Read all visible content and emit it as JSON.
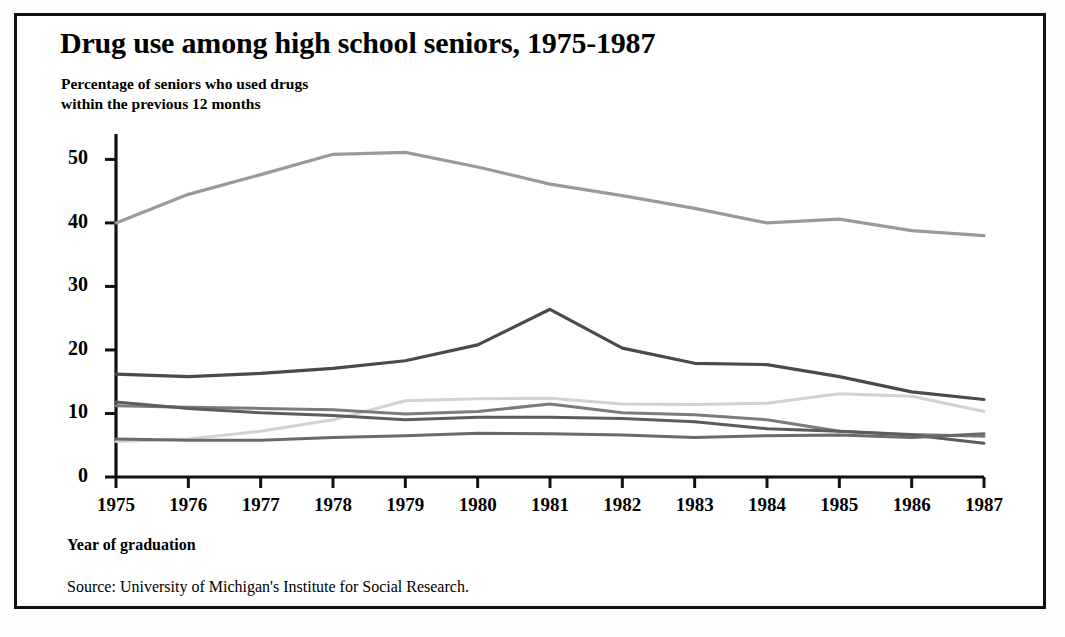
{
  "figure": {
    "title": "Drug use among high school seniors, 1975-1987",
    "subtitle": "Percentage of seniors who used drugs\nwithin the previous 12 months",
    "xaxis_title": "Year of graduation",
    "source": "Source: University of Michigan's Institute for Social Research.",
    "frame_color": "#111111",
    "background_color": "#ffffff"
  },
  "chart_data": {
    "type": "line",
    "title": "Drug use among high school seniors, 1975-1987",
    "subtitle": "Percentage of seniors who used drugs within the previous 12 months",
    "xlabel": "Year of graduation",
    "ylabel": "",
    "categories": [
      "1975",
      "1976",
      "1977",
      "1978",
      "1979",
      "1980",
      "1981",
      "1982",
      "1983",
      "1984",
      "1985",
      "1986",
      "1987"
    ],
    "x": [
      1975,
      1976,
      1977,
      1978,
      1979,
      1980,
      1981,
      1982,
      1983,
      1984,
      1985,
      1986,
      1987
    ],
    "xlim": [
      1975,
      1987
    ],
    "ylim": [
      0,
      54
    ],
    "yticks": [
      0,
      10,
      20,
      30,
      40,
      50
    ],
    "xticks": [
      1975,
      1976,
      1977,
      1978,
      1979,
      1980,
      1981,
      1982,
      1983,
      1984,
      1985,
      1986,
      1987
    ],
    "ytick_labels": [
      "0",
      "10",
      "20",
      "30",
      "40",
      "50"
    ],
    "grid": false,
    "legend": "none",
    "series": [
      {
        "name": "marijuana",
        "color": "#9a9a9a",
        "width": 3.2,
        "values": [
          40.0,
          44.5,
          47.6,
          50.8,
          51.1,
          48.8,
          46.1,
          44.3,
          42.3,
          40.0,
          40.6,
          38.8,
          38.0
        ]
      },
      {
        "name": "stimulants",
        "color": "#4a4a4a",
        "width": 3.2,
        "values": [
          16.2,
          15.8,
          16.3,
          17.1,
          18.3,
          20.8,
          26.4,
          20.3,
          17.9,
          17.7,
          15.8,
          13.4,
          12.2
        ]
      },
      {
        "name": "cocaine",
        "color": "#d2d2d2",
        "width": 3.0,
        "values": [
          5.6,
          6.0,
          7.2,
          9.0,
          12.0,
          12.3,
          12.4,
          11.5,
          11.4,
          11.6,
          13.1,
          12.7,
          10.3
        ]
      },
      {
        "name": "hallucinogens",
        "color": "#7b7b7b",
        "width": 3.0,
        "values": [
          11.2,
          11.0,
          10.8,
          10.6,
          9.9,
          10.3,
          11.5,
          10.1,
          9.8,
          9.0,
          7.2,
          6.7,
          6.4
        ]
      },
      {
        "name": "tranquilizers",
        "color": "#5c5c5c",
        "width": 3.0,
        "values": [
          11.8,
          10.8,
          10.1,
          9.7,
          9.0,
          9.4,
          9.4,
          9.2,
          8.7,
          7.6,
          7.2,
          6.6,
          5.3
        ]
      },
      {
        "name": "sedatives",
        "color": "#6a6a6a",
        "width": 3.0,
        "values": [
          6.0,
          5.8,
          5.8,
          6.2,
          6.5,
          6.9,
          6.8,
          6.6,
          6.2,
          6.5,
          6.6,
          6.2,
          6.8
        ]
      }
    ]
  },
  "axes": {
    "y_tick_labels": [
      "50",
      "40",
      "30",
      "20",
      "10",
      "0"
    ],
    "x_tick_labels": [
      "1975",
      "1976",
      "1977",
      "1978",
      "1979",
      "1980",
      "1981",
      "1982",
      "1983",
      "1984",
      "1985",
      "1986",
      "1987"
    ]
  }
}
